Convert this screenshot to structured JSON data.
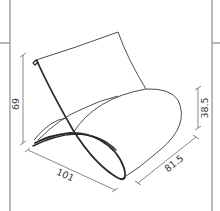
{
  "diagram": {
    "dimensions": {
      "height": "69",
      "length": "101",
      "depth": "81.5",
      "seat_height": "38.5"
    },
    "colors": {
      "line": "#2a2a2a",
      "frame": "#8a8a8a",
      "background": "#ffffff"
    }
  }
}
